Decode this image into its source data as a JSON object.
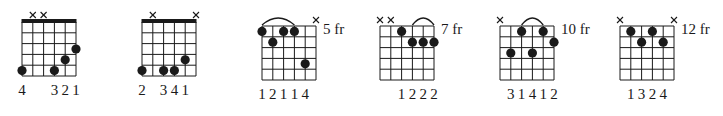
{
  "style": {
    "ink": "#1a1a1a",
    "background": "#ffffff"
  },
  "chords": [
    {
      "id": "chord-1",
      "left": 22,
      "top": 22,
      "nut": true,
      "fret_label": "",
      "muted": [
        2,
        3
      ],
      "dots": [
        {
          "s": 1,
          "f": 5
        },
        {
          "s": 4,
          "f": 5
        },
        {
          "s": 5,
          "f": 4
        },
        {
          "s": 6,
          "f": 3
        }
      ],
      "arcs": [],
      "fingers": [
        "4",
        "",
        "",
        "3",
        "2",
        "1"
      ]
    },
    {
      "id": "chord-2",
      "left": 142,
      "top": 22,
      "nut": true,
      "fret_label": "",
      "muted": [
        2,
        6
      ],
      "dots": [
        {
          "s": 1,
          "f": 5
        },
        {
          "s": 3,
          "f": 5
        },
        {
          "s": 4,
          "f": 5
        },
        {
          "s": 5,
          "f": 4
        }
      ],
      "arcs": [],
      "fingers": [
        "2",
        "",
        "3",
        "4",
        "1",
        ""
      ]
    },
    {
      "id": "chord-3",
      "left": 262,
      "top": 26,
      "nut": false,
      "fret_label": "5 fr",
      "muted": [
        6
      ],
      "dots": [
        {
          "s": 1,
          "f": 1
        },
        {
          "s": 2,
          "f": 2
        },
        {
          "s": 3,
          "f": 1
        },
        {
          "s": 4,
          "f": 1
        },
        {
          "s": 5,
          "f": 4
        }
      ],
      "arcs": [
        {
          "from": 1,
          "to": 4
        }
      ],
      "fingers": [
        "1",
        "2",
        "1",
        "1",
        "4",
        ""
      ]
    },
    {
      "id": "chord-4",
      "left": 380,
      "top": 26,
      "nut": false,
      "fret_label": "7 fr",
      "muted": [
        1,
        2
      ],
      "dots": [
        {
          "s": 3,
          "f": 1
        },
        {
          "s": 4,
          "f": 2
        },
        {
          "s": 5,
          "f": 2
        },
        {
          "s": 6,
          "f": 2
        }
      ],
      "arcs": [
        {
          "from": 4,
          "to": 6
        }
      ],
      "fingers": [
        "",
        "",
        "1",
        "2",
        "2",
        "2"
      ]
    },
    {
      "id": "chord-5",
      "left": 500,
      "top": 26,
      "nut": false,
      "fret_label": "10 fr",
      "muted": [
        1
      ],
      "dots": [
        {
          "s": 2,
          "f": 3
        },
        {
          "s": 3,
          "f": 1
        },
        {
          "s": 4,
          "f": 3
        },
        {
          "s": 5,
          "f": 1
        },
        {
          "s": 6,
          "f": 2
        }
      ],
      "arcs": [
        {
          "from": 3,
          "to": 5
        }
      ],
      "fingers": [
        "",
        "3",
        "1",
        "4",
        "1",
        "2"
      ]
    },
    {
      "id": "chord-6",
      "left": 620,
      "top": 26,
      "nut": false,
      "fret_label": "12 fr",
      "muted": [
        1,
        6
      ],
      "dots": [
        {
          "s": 2,
          "f": 1
        },
        {
          "s": 3,
          "f": 2
        },
        {
          "s": 4,
          "f": 1
        },
        {
          "s": 5,
          "f": 2
        }
      ],
      "arcs": [],
      "fingers": [
        "",
        "1",
        "3",
        "2",
        "4",
        ""
      ]
    }
  ]
}
